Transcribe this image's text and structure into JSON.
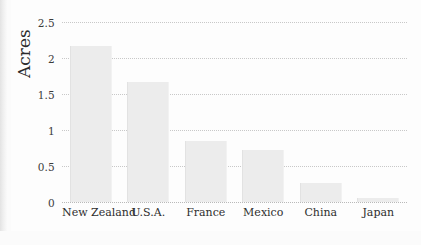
{
  "chart_data": {
    "type": "bar",
    "title": "",
    "xlabel": "",
    "ylabel": "Acres",
    "categories": [
      "New Zealand",
      "U.S.A.",
      "France",
      "Mexico",
      "China",
      "Japan"
    ],
    "values": [
      2.16,
      1.66,
      0.85,
      0.72,
      0.26,
      0.06
    ],
    "ylim": [
      0,
      2.5
    ],
    "yticks": [
      0,
      0.5,
      1,
      1.5,
      2,
      2.5
    ],
    "ytick_labels": [
      "0",
      "0.5",
      "1",
      "1.5",
      "2",
      "2.5"
    ],
    "grid": true,
    "grid_style": "dotted horizontal",
    "legend": "none",
    "bar_color": "#ececec",
    "text_color": "#2e2e2e",
    "background": "#fdfdfd"
  }
}
